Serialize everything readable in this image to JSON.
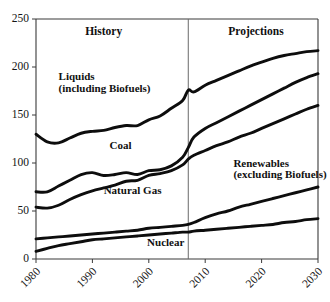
{
  "chart_data": {
    "type": "line",
    "title": "",
    "xlabel": "",
    "ylabel": "",
    "xlim": [
      1980,
      2030
    ],
    "ylim": [
      0,
      250
    ],
    "grid": false,
    "legend_position": "inline-annotations",
    "xticks": [
      "1980",
      "1990",
      "2000",
      "2010",
      "2020",
      "2030"
    ],
    "xtick_values": [
      1980,
      1990,
      2000,
      2010,
      2020,
      2030
    ],
    "yticks": [
      "0",
      "50",
      "100",
      "150",
      "200",
      "250"
    ],
    "ytick_values": [
      0,
      50,
      100,
      150,
      200,
      250
    ],
    "annotations": [
      {
        "text": "History",
        "x": 1992,
        "y": 233
      },
      {
        "text": "Projections",
        "x": 2019,
        "y": 233
      },
      {
        "text": "Liquids",
        "x": 1984,
        "y": 186
      },
      {
        "text": "(including Biofuels)",
        "x": 1984,
        "y": 174
      },
      {
        "text": "Coal",
        "x": 1995,
        "y": 115
      },
      {
        "text": "Natural Gas",
        "x": 1992,
        "y": 68
      },
      {
        "text": "Renewables",
        "x": 2015,
        "y": 96
      },
      {
        "text": "(excluding Biofuels)",
        "x": 2015,
        "y": 84
      },
      {
        "text": "Nuclear",
        "x": 2003,
        "y": 14
      }
    ],
    "divider": {
      "x": 2007,
      "label_left": "History",
      "label_right": "Projections"
    },
    "x": [
      1980,
      1982,
      1984,
      1986,
      1988,
      1990,
      1992,
      1994,
      1996,
      1998,
      2000,
      2002,
      2004,
      2006,
      2007,
      2008,
      2010,
      2012,
      2014,
      2016,
      2018,
      2020,
      2022,
      2024,
      2026,
      2028,
      2030
    ],
    "series": [
      {
        "name": "Liquids (including Biofuels)",
        "values": [
          130,
          122,
          121,
          126,
          131,
          133,
          134,
          137,
          139,
          139,
          145,
          149,
          157,
          165,
          176,
          174,
          181,
          186,
          191,
          196,
          201,
          205,
          209,
          212,
          214,
          216,
          217
        ]
      },
      {
        "name": "Coal",
        "values": [
          70,
          70,
          76,
          82,
          88,
          90,
          87,
          88,
          90,
          88,
          92,
          93,
          97,
          106,
          116,
          127,
          136,
          142,
          148,
          154,
          160,
          166,
          172,
          178,
          184,
          189,
          193
        ]
      },
      {
        "name": "Natural Gas",
        "values": [
          54,
          53,
          56,
          62,
          67,
          71,
          74,
          77,
          81,
          82,
          87,
          89,
          92,
          98,
          104,
          108,
          113,
          118,
          122,
          127,
          131,
          136,
          141,
          146,
          151,
          156,
          160
        ]
      },
      {
        "name": "Renewables (excluding Biofuels)",
        "values": [
          21,
          22,
          23,
          24,
          25,
          26,
          27,
          28,
          29,
          30,
          32,
          33,
          34,
          35,
          36,
          38,
          43,
          47,
          50,
          54,
          57,
          60,
          63,
          66,
          69,
          72,
          75
        ]
      },
      {
        "name": "Nuclear",
        "values": [
          8,
          11,
          14,
          16,
          18,
          20,
          21,
          22,
          23,
          24,
          25,
          26,
          27,
          28,
          28,
          29,
          30,
          31,
          32,
          33,
          34,
          35,
          36,
          38,
          39,
          41,
          42
        ]
      }
    ]
  },
  "colors": {
    "series_stroke": "#0d0d0d",
    "axis": "#3a3a3a",
    "divider": "#6a6a6a",
    "background": "#ffffff"
  }
}
